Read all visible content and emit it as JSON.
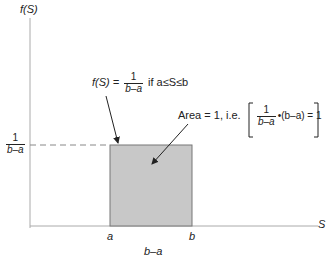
{
  "diagram": {
    "type": "uniform-distribution-pdf",
    "y_axis_label": "f(S)",
    "x_axis_label": "S",
    "y_tick_label": {
      "num": "1",
      "den": "b–a"
    },
    "x_ticks": [
      "a",
      "b"
    ],
    "width_label": "b–a",
    "pdf_annotation": {
      "lhs": "f(S) =",
      "num": "1",
      "den": "b–a",
      "condition": "if a≤S≤b"
    },
    "area_annotation": {
      "prefix": "Area = 1, i.e.",
      "num": "1",
      "den": "b–a",
      "suffix": "•(b–a) = 1"
    },
    "colors": {
      "fill": "#c8c8c8",
      "axis": "#999999",
      "edge": "#666666",
      "arrow": "#222222"
    }
  }
}
